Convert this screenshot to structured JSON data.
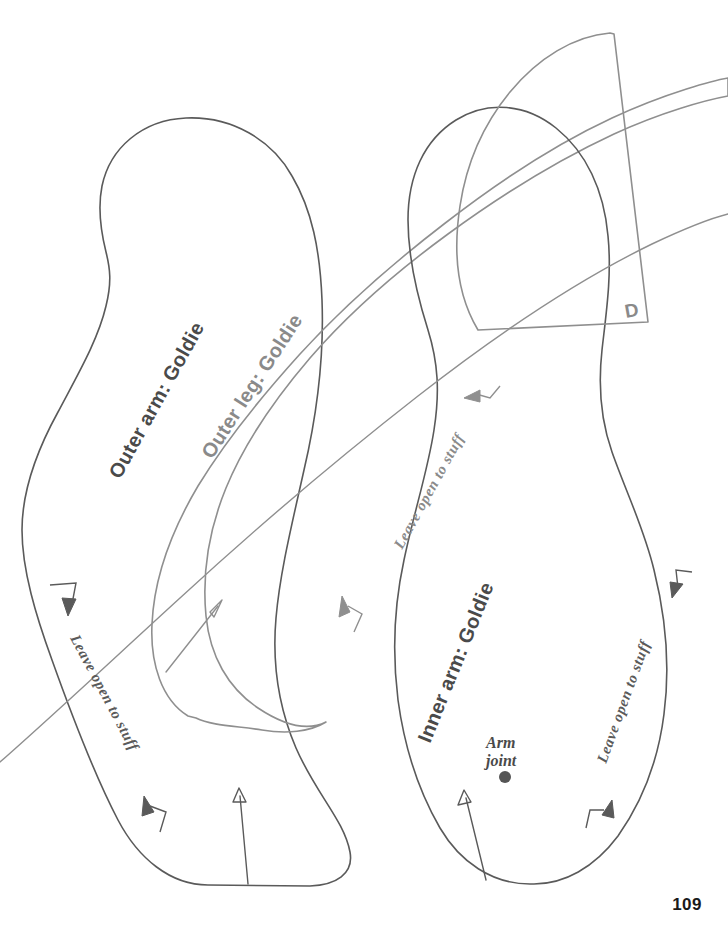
{
  "page": {
    "number": "109",
    "width": 728,
    "height": 949,
    "background": "#ffffff",
    "kind": "sewing-pattern-sheet"
  },
  "colors": {
    "outline_dark": "#5a5a5a",
    "outline_gray": "#8f8f8f",
    "text_dark": "#4a4a4a",
    "text_gray": "#8a8a8a",
    "text_serif": "#5a5a5a",
    "page_number": "#1a1a1a",
    "joint_dot": "#555555"
  },
  "pieces": [
    {
      "id": "outer-arm",
      "label": "Outer arm: Goldie",
      "stroke": "#5a5a5a",
      "label_color": "#4a4a4a",
      "label_rotation": -62,
      "label_x": 120,
      "label_y": 478
    },
    {
      "id": "outer-leg",
      "label": "Outer leg: Goldie",
      "stroke": "#8f8f8f",
      "label_color": "#8a8a8a",
      "label_rotation": -58,
      "label_x": 214,
      "label_y": 462
    },
    {
      "id": "inner-arm",
      "label": "Inner arm: Goldie",
      "stroke": "#5a5a5a",
      "label_color": "#4a4a4a",
      "label_rotation": -68,
      "label_x": 432,
      "label_y": 742
    },
    {
      "id": "d-flap",
      "label": "D",
      "stroke": "#8f8f8f",
      "label_color": "#8a8a8a",
      "label_x": 630,
      "label_y": 318
    }
  ],
  "annotations": [
    {
      "id": "leave-open-outer-arm",
      "text": "Leave open to stuff",
      "color": "#5a5a5a",
      "rotation": 62,
      "x": 68,
      "y": 638
    },
    {
      "id": "leave-open-diagonal",
      "text": "Leave open to  stuff",
      "color": "#8a8a8a",
      "rotation": -63,
      "x": 404,
      "y": 548
    },
    {
      "id": "leave-open-inner-arm",
      "text": "Leave open to stuff",
      "color": "#5a5a5a",
      "rotation": -70,
      "x": 608,
      "y": 762
    }
  ],
  "markers": [
    {
      "id": "arm-joint",
      "text_line_1": "Arm",
      "text_line_2": "joint",
      "color": "#4a4a4a",
      "dot_color": "#555555",
      "text_x": 508,
      "text_y": 745,
      "dot_x": 505,
      "dot_y": 777,
      "dot_radius": 6
    }
  ],
  "grain_lines": [
    {
      "id": "grain-outer-leg",
      "x1": 166,
      "y1": 672,
      "x2": 222,
      "y2": 602
    },
    {
      "id": "grain-outer-arm",
      "x1": 240,
      "y1": 880,
      "x2": 240,
      "y2": 790
    },
    {
      "id": "grain-inner-arm",
      "x1": 484,
      "y1": 878,
      "x2": 464,
      "y2": 792
    }
  ],
  "notches": [
    {
      "id": "notch-outer-arm-top",
      "x": 58,
      "y": 588,
      "direction": "down-right"
    },
    {
      "id": "notch-outer-arm-bottom",
      "x": 152,
      "y": 808,
      "direction": "up-right"
    },
    {
      "id": "notch-outer-leg-mid",
      "x": 352,
      "y": 608,
      "direction": "up-right"
    },
    {
      "id": "notch-diagonal-top",
      "x": 476,
      "y": 392,
      "direction": "left-down"
    },
    {
      "id": "notch-inner-arm-top",
      "x": 680,
      "y": 580,
      "direction": "down-left"
    },
    {
      "id": "notch-inner-arm-bottom",
      "x": 588,
      "y": 808,
      "direction": "up-right"
    }
  ]
}
